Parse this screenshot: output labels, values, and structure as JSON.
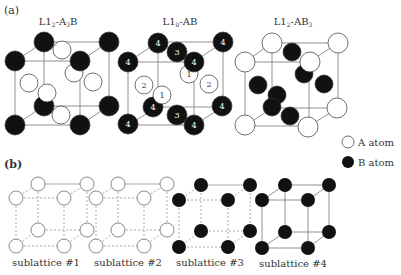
{
  "panel_a": {
    "label": "(a)",
    "structures": [
      {
        "title": "L1₂-A₃B",
        "title_main": "L1",
        "title_sub": "2",
        "title_rest": "-A",
        "title_rest_sub": "3",
        "title_end": "B"
      },
      {
        "title": "L1₀-AB",
        "title_main": "L1",
        "title_sub": "0",
        "title_rest": "-AB",
        "title_rest_sub": "",
        "title_end": ""
      },
      {
        "title": "L1₂-AB₃",
        "title_main": "L1",
        "title_sub": "2",
        "title_rest": "-AB",
        "title_rest_sub": "3",
        "title_end": ""
      }
    ],
    "l10_site_numbers": {
      "corner": "4",
      "top_bottom_face": "3",
      "front_back_face": "1",
      "side_face": "2"
    }
  },
  "legend": {
    "a_atom": "A atom",
    "b_atom": "B atom"
  },
  "panel_b": {
    "label": "(b)",
    "sublattices": [
      "sublattice #1",
      "sublattice #2",
      "sublattice #3",
      "sublattice #4"
    ]
  },
  "colors": {
    "b_atom_fill": "#111111",
    "a_atom_fill": "#ffffff",
    "edge": "#777777",
    "text": "#333333"
  }
}
